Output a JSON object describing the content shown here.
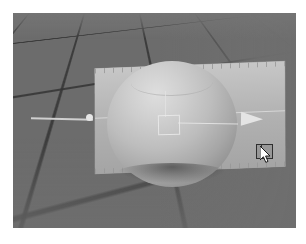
{
  "figure": {
    "kind": "3d-modeling-viewport-screenshot",
    "caption": ""
  },
  "viewport": {
    "name": "perspective-viewport",
    "background_color": "#6e6e6e",
    "shading_mode": "smooth-shaded",
    "grid": {
      "visible": true,
      "line_color": "#343434",
      "floor_color": "#6c6c6c",
      "orientation": "perspective-ground-plane"
    }
  },
  "scene": {
    "objects": [
      {
        "name": "sphere",
        "type": "sphere",
        "label": "Sphere",
        "color": "#bdbdbd",
        "highlight_color": "#dedede",
        "shadow_color": "#6f6f6f"
      },
      {
        "name": "plane",
        "type": "plane",
        "label": "Plane",
        "color": "#b9b9b9",
        "selected": true
      }
    ]
  },
  "manipulator": {
    "name": "translate-manipulator",
    "label": "Move",
    "axis_color": "#dcdcdc",
    "handles": [
      {
        "name": "axis-handle-dot",
        "label": "Axis Handle",
        "shape": "dot"
      },
      {
        "name": "axis-handle-cone",
        "label": "Axis Arrow",
        "shape": "cone"
      },
      {
        "name": "center-handle-square",
        "label": "Center Handle",
        "shape": "square"
      }
    ]
  },
  "cursor": {
    "name": "mouse-cursor",
    "type": "arrow",
    "x": 247,
    "y": 133,
    "widget_label": ""
  }
}
